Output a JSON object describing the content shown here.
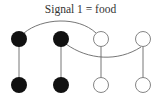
{
  "title": "Signal 1 = food",
  "colors": {
    "filled": "#111111",
    "open_fill": "#ffffff",
    "open_stroke": "#777777",
    "edge": "#666666",
    "text": "#333333"
  },
  "nodes": [
    {
      "id": "top-1",
      "x": 19,
      "y": 39,
      "filled": true
    },
    {
      "id": "top-2",
      "x": 61,
      "y": 39,
      "filled": true
    },
    {
      "id": "top-3",
      "x": 101,
      "y": 39,
      "filled": false
    },
    {
      "id": "top-4",
      "x": 143,
      "y": 39,
      "filled": false
    },
    {
      "id": "bottom-1",
      "x": 19,
      "y": 85,
      "filled": true
    },
    {
      "id": "bottom-2",
      "x": 61,
      "y": 85,
      "filled": true
    },
    {
      "id": "bottom-3",
      "x": 101,
      "y": 85,
      "filled": false
    },
    {
      "id": "bottom-4",
      "x": 143,
      "y": 85,
      "filled": false
    }
  ],
  "edges": [
    {
      "from": "top-1",
      "to": "bottom-1",
      "type": "straight"
    },
    {
      "from": "top-2",
      "to": "bottom-2",
      "type": "straight"
    },
    {
      "from": "top-3",
      "to": "bottom-3",
      "type": "straight"
    },
    {
      "from": "top-4",
      "to": "bottom-4",
      "type": "straight"
    },
    {
      "from": "top-1",
      "to": "top-3",
      "type": "arc-over"
    },
    {
      "from": "top-2",
      "to": "top-4",
      "type": "arc-under"
    }
  ]
}
